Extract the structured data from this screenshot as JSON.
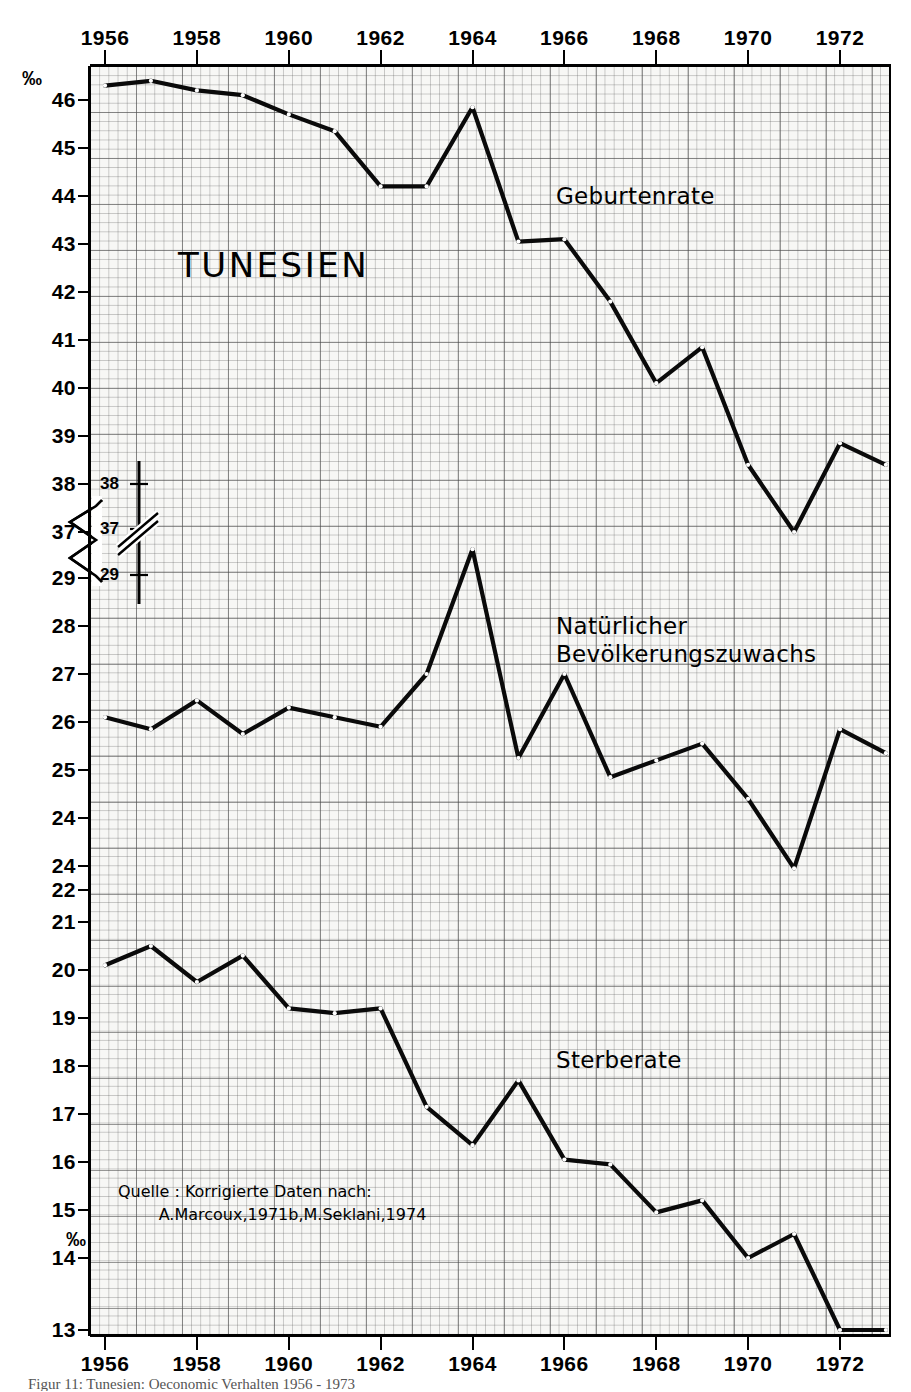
{
  "figure": {
    "title": "TUNESIEN",
    "unit_top": "‰",
    "unit_bottom": "‰",
    "source_note": "Quelle : Korrigierte Daten nach:\n        A.Marcoux,1971b,M.Seklani,1974",
    "caption": "Figur 11:  Tunesien: Oeconomic Verhalten 1956 - 1973",
    "accent_color": "#000000",
    "plot_bg_color": "#f7f7f5",
    "grid_color": "#505050"
  },
  "axis_break": {
    "upper_value": "37",
    "lower_value": "29",
    "note": "zigzag break between 37 and 29 on vertical axis"
  },
  "inset_scale": {
    "labels": [
      "38",
      "37",
      "29"
    ],
    "break_marks": 2
  },
  "chart_data": {
    "type": "line",
    "title": "TUNESIEN",
    "xlabel": "",
    "ylabel": "‰",
    "grid": true,
    "legend_position": "inline-annotations",
    "x": [
      1956,
      1957,
      1958,
      1959,
      1960,
      1961,
      1962,
      1963,
      1964,
      1965,
      1966,
      1967,
      1968,
      1969,
      1970,
      1971,
      1972,
      1973
    ],
    "xtick_labels_top": [
      "1956",
      "1958",
      "1960",
      "1962",
      "1964",
      "1966",
      "1968",
      "1970",
      "1972"
    ],
    "xtick_labels_bottom": [
      "1956",
      "1958",
      "1960",
      "1962",
      "1964",
      "1966",
      "1968",
      "1970",
      "1972"
    ],
    "ytick_labels": [
      "46",
      "45",
      "44",
      "43",
      "42",
      "41",
      "40",
      "39",
      "38",
      "37",
      "29",
      "28",
      "27",
      "26",
      "25",
      "24",
      "24",
      "22",
      "21",
      "20",
      "19",
      "18",
      "17",
      "16",
      "15",
      "14",
      "13"
    ],
    "ylim_upper_segment": [
      37,
      46.6
    ],
    "ylim_lower_segment": [
      13,
      29
    ],
    "series": [
      {
        "name": "Geburtenrate",
        "label_x": 1966.0,
        "label_y": 44.05,
        "values": [
          46.3,
          46.4,
          46.2,
          46.1,
          45.7,
          45.35,
          44.2,
          44.2,
          45.85,
          43.05,
          43.1,
          41.8,
          40.1,
          40.85,
          38.4,
          37.0,
          38.85,
          38.4
        ]
      },
      {
        "name": "Natürlicher\nBevölkerungszuwachs",
        "label_x": 1966.2,
        "label_y": 28.3,
        "values": [
          26.1,
          25.85,
          26.45,
          25.75,
          26.3,
          26.1,
          25.9,
          27.0,
          29.6,
          25.25,
          27.0,
          24.85,
          25.2,
          25.55,
          24.4,
          22.9,
          25.85,
          25.35
        ]
      },
      {
        "name": "Sterberate",
        "label_x": 1966.0,
        "label_y": 18.15,
        "values": [
          20.1,
          20.5,
          19.75,
          20.3,
          19.2,
          19.1,
          19.2,
          17.15,
          16.35,
          17.7,
          16.05,
          15.95,
          14.95,
          15.2,
          14.0,
          14.5,
          13.0,
          13.0
        ]
      }
    ]
  }
}
